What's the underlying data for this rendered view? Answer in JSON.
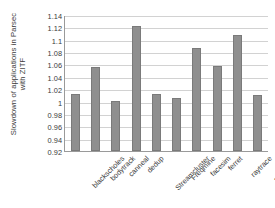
{
  "chart_data": {
    "type": "bar",
    "title": "",
    "subtitle": "",
    "xlabel": "",
    "ylabel": "Slowdown of applications in Parsec with ZITF",
    "ylabel_lines": [
      "Slowdown of applications in Parsec",
      "with ZITF"
    ],
    "categories": [
      "blackscholes",
      "bodytrack",
      "canneal",
      "dedup",
      "Streamcluster",
      "Freqmine",
      "facesim",
      "ferret",
      "raytrace",
      "swaptions"
    ],
    "values": [
      1.012,
      1.056,
      1.001,
      1.122,
      1.012,
      1.006,
      1.087,
      1.057,
      1.107,
      1.011
    ],
    "ylim": [
      0.92,
      1.14
    ],
    "ytick_labels": [
      "1.14",
      "1.12",
      "1.1",
      "1.08",
      "1.06",
      "1.04",
      "1.02",
      "1",
      "0.98",
      "0.96",
      "0.94",
      "0.92"
    ],
    "ytick_values": [
      1.14,
      1.12,
      1.1,
      1.08,
      1.06,
      1.04,
      1.02,
      1,
      0.98,
      0.96,
      0.94,
      0.92
    ],
    "ytick_step": 0.02,
    "grid": true,
    "grid_axis": "y",
    "legend": false,
    "legend_position": "none",
    "bar_color": "#8f8f8f",
    "bar_border_color": "#7a7a7a",
    "grid_color": "#d2d2d2",
    "axis_color": "#9a9a9a",
    "text_color": "#3b3b3b",
    "background_color": "#ffffff",
    "xtick_label_rotation": -45,
    "annotations": []
  }
}
